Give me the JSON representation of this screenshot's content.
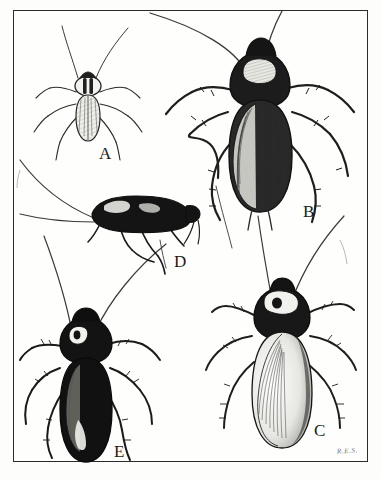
{
  "plate": {
    "title": "Cockroach Identification Plate",
    "medium": "pen-and-ink line drawing",
    "background_color": "#fdfdfb",
    "ink_color": "#1b1b1b",
    "frame_color": "#2b2b2b",
    "signature": "R.E.S."
  },
  "labels": {
    "a": "A",
    "b": "B",
    "c": "C",
    "d": "D",
    "e": "E"
  },
  "specimens": [
    {
      "label": "A",
      "view": "dorsal",
      "relative_size": "small",
      "shading": "pale body with two dark longitudinal stripes on pronotum",
      "position": "upper-left"
    },
    {
      "label": "B",
      "view": "dorsal",
      "relative_size": "large",
      "shading": "dark body with pale crescent marking on pronotum, hatched wings",
      "position": "upper-right"
    },
    {
      "label": "C",
      "view": "dorsal",
      "relative_size": "large",
      "shading": "dark pronotum with pale ring marking, pale finely-veined wings",
      "position": "lower-right"
    },
    {
      "label": "D",
      "view": "lateral",
      "relative_size": "medium",
      "shading": "solid black body in side profile",
      "position": "middle-left"
    },
    {
      "label": "E",
      "view": "dorsal",
      "relative_size": "medium",
      "shading": "very dark body with pale pronotum band and pale wing streak",
      "position": "lower-left"
    }
  ]
}
